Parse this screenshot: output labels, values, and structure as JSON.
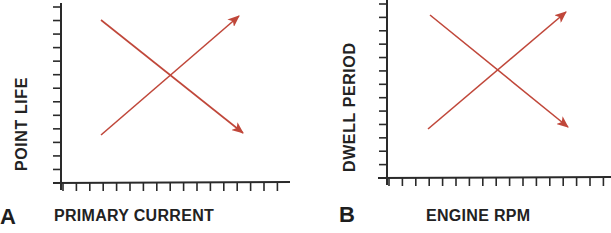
{
  "colors": {
    "axis": "#2a2a2a",
    "arrow": "#c0473a",
    "text": "#222222",
    "background": "#ffffff"
  },
  "panels": [
    {
      "letter": "A",
      "x_label": "PRIMARY CURRENT",
      "y_label": "POINT LIFE",
      "axis": {
        "origin_x": 61,
        "origin_y": 183,
        "y_top": 3,
        "x_right": 290,
        "x_left": 53
      },
      "y_ticks": 13,
      "x_ticks": 17,
      "arrows": [
        {
          "name": "decreasing-line",
          "x1": 101,
          "y1": 20,
          "x2": 243,
          "y2": 133
        },
        {
          "name": "increasing-line",
          "x1": 101,
          "y1": 135,
          "x2": 239,
          "y2": 16
        }
      ]
    },
    {
      "letter": "B",
      "x_label": "ENGINE RPM",
      "y_label": "DWELL PERIOD",
      "axis": {
        "origin_x": 387,
        "origin_y": 178,
        "y_top": 0,
        "x_right": 611,
        "x_left": 378
      },
      "y_ticks": 13,
      "x_ticks": 18,
      "arrows": [
        {
          "name": "decreasing-line",
          "x1": 430,
          "y1": 15,
          "x2": 568,
          "y2": 127
        },
        {
          "name": "increasing-line",
          "x1": 428,
          "y1": 129,
          "x2": 566,
          "y2": 12
        }
      ]
    }
  ],
  "chart_data": [
    {
      "type": "line",
      "title": "A",
      "xlabel": "PRIMARY CURRENT",
      "ylabel": "POINT LIFE",
      "grid": false,
      "series": [
        {
          "name": "Point life vs primary current (decreasing)",
          "x": [
            0,
            1
          ],
          "y": [
            1,
            0
          ]
        },
        {
          "name": "Opposing trend (increasing)",
          "x": [
            0,
            1
          ],
          "y": [
            0,
            1
          ]
        }
      ],
      "annotations": [
        "Two crossing arrows: as primary current increases, point life decreases"
      ]
    },
    {
      "type": "line",
      "title": "B",
      "xlabel": "ENGINE RPM",
      "ylabel": "DWELL PERIOD",
      "grid": false,
      "series": [
        {
          "name": "Dwell period vs engine RPM (decreasing)",
          "x": [
            0,
            1
          ],
          "y": [
            1,
            0
          ]
        },
        {
          "name": "Opposing trend (increasing)",
          "x": [
            0,
            1
          ],
          "y": [
            0,
            1
          ]
        }
      ],
      "annotations": [
        "Two crossing arrows: as engine RPM increases, dwell period decreases"
      ]
    }
  ]
}
